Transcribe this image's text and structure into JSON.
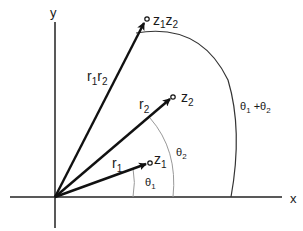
{
  "diagram": {
    "axes": {
      "x_label": "x",
      "y_label": "y"
    },
    "vectors": [
      {
        "id": "z1",
        "point_label": "z",
        "point_sub": "1",
        "length_label": "r",
        "length_sub": "1"
      },
      {
        "id": "z2",
        "point_label": "z",
        "point_sub": "2",
        "length_label": "r",
        "length_sub": "2"
      },
      {
        "id": "z1z2",
        "point_label": "z",
        "point_sub": "1",
        "point_label2": "z",
        "point_sub2": "2",
        "length_label": "r",
        "length_sub": "1",
        "length_label2": "r",
        "length_sub2": "2"
      }
    ],
    "angles": [
      {
        "id": "theta1",
        "label": "θ",
        "sub": "1"
      },
      {
        "id": "theta2",
        "label": "θ",
        "sub": "2"
      },
      {
        "id": "theta1plus2",
        "label": "θ",
        "sub": "1",
        "plus": " +",
        "label2": "θ",
        "sub2": "2"
      }
    ]
  }
}
